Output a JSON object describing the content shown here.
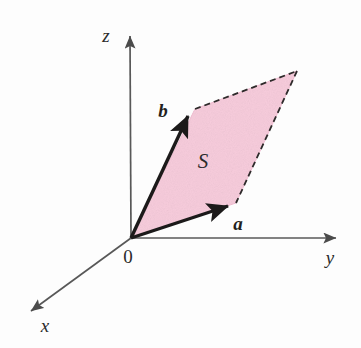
{
  "figure": {
    "background_color": "#fdfdfd",
    "axis_color": "#585858",
    "vector_color": "#1c1a1a",
    "dashed_color": "#2e2b2b",
    "fill_color": "#f7ccdc",
    "fill_edge_color": "#efb9cd"
  },
  "axes": [
    {
      "name": "z-axis",
      "label": "z",
      "label_x": 106,
      "label_y": 42,
      "from_x": 131,
      "from_y": 238,
      "to_x": 130,
      "to_y": 33
    },
    {
      "name": "y-axis",
      "label": "y",
      "label_x": 326,
      "label_y": 264,
      "from_x": 131,
      "from_y": 238,
      "to_x": 341,
      "to_y": 238
    },
    {
      "name": "x-axis",
      "label": "x",
      "label_x": 41,
      "label_y": 332,
      "from_x": 131,
      "from_y": 238,
      "to_x": 27,
      "to_y": 314
    }
  ],
  "origin": {
    "label": "0",
    "x": 131,
    "y": 238,
    "label_x": 124,
    "label_y": 262
  },
  "vectors": [
    {
      "name": "vector-a",
      "label": "a",
      "tip_x": 233,
      "tip_y": 205,
      "label_x": 238,
      "label_y": 228
    },
    {
      "name": "vector-b",
      "label": "b",
      "tip_x": 192,
      "tip_y": 113,
      "label_x": 160,
      "label_y": 116
    }
  ],
  "parallelogram": {
    "name": "spanned-region",
    "label": "S",
    "label_x": 200,
    "label_y": 168,
    "vertices": [
      {
        "name": "origin",
        "x": 131,
        "y": 238
      },
      {
        "name": "a-tip",
        "x": 236,
        "y": 203
      },
      {
        "name": "a-plus-b",
        "x": 297,
        "y": 71
      },
      {
        "name": "b-tip",
        "x": 195,
        "y": 109
      }
    ],
    "solid_edges": [
      "origin-to-a-tip",
      "origin-to-b-tip"
    ],
    "dashed_edges": [
      "b-tip-to-a-plus-b",
      "a-tip-to-a-plus-b"
    ]
  }
}
